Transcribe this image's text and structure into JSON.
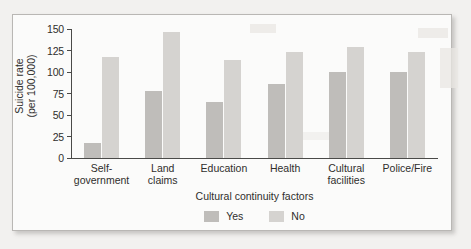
{
  "chart_data": {
    "type": "bar",
    "title": "",
    "xlabel": "Cultural continuity factors",
    "ylabel": "Suicide rate (per 100,000)",
    "ylabel_line1": "Suicide rate",
    "ylabel_line2": "(per 100,000)",
    "categories": [
      "Self-government",
      "Land claims",
      "Education",
      "Health",
      "Cultural facilities",
      "Police/Fire"
    ],
    "category_lines": [
      [
        "Self-government"
      ],
      [
        "Land",
        "claims"
      ],
      [
        "Education"
      ],
      [
        "Health"
      ],
      [
        "Cultural",
        "facilities"
      ],
      [
        "Police/Fire"
      ]
    ],
    "series": [
      {
        "name": "Yes",
        "color": "#bfbdba",
        "values": [
          18,
          78,
          65,
          86,
          100,
          100
        ]
      },
      {
        "name": "No",
        "color": "#d5d3d0",
        "values": [
          117,
          147,
          114,
          123,
          129,
          123
        ]
      }
    ],
    "ylim": [
      0,
      150
    ],
    "yticks": [
      0,
      25,
      50,
      75,
      100,
      125,
      150
    ],
    "ytick_labels": [
      "0",
      "25",
      "50",
      "75",
      "100",
      "125",
      "150"
    ],
    "grid": false,
    "legend_position": "bottom"
  },
  "legend": {
    "items": [
      {
        "label": "Yes",
        "color": "#bfbdba"
      },
      {
        "label": "No",
        "color": "#d5d3d0"
      }
    ]
  }
}
